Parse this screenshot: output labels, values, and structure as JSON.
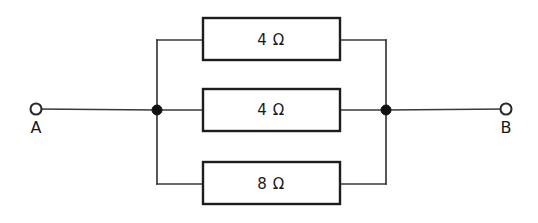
{
  "figure": {
    "type": "circuit-diagram",
    "background_color": "#ffffff",
    "line_color": "#3a3a3a",
    "box_stroke_color": "#1d1d1d",
    "node_color": "#111111"
  },
  "terminals": [
    {
      "id": "A",
      "label": "A",
      "cx": 36,
      "cy": 109,
      "r": 5.5
    },
    {
      "id": "B",
      "label": "B",
      "cx": 506,
      "cy": 109,
      "r": 5.5
    }
  ],
  "nodes": [
    {
      "id": "left-node",
      "cx": 157,
      "cy": 110,
      "r": 5
    },
    {
      "id": "right-node",
      "cx": 386,
      "cy": 110,
      "r": 5
    }
  ],
  "branches": [
    {
      "id": "top",
      "label": "4 Ω",
      "value": 4,
      "unit": "Ω",
      "box": {
        "x": 203,
        "y": 18,
        "width": 137,
        "height": 42
      },
      "label_x": 271,
      "label_y": 40
    },
    {
      "id": "middle",
      "label": "4 Ω",
      "value": 4,
      "unit": "Ω",
      "box": {
        "x": 203,
        "y": 89,
        "width": 137,
        "height": 42
      },
      "label_x": 271,
      "label_y": 110
    },
    {
      "id": "bottom",
      "label": "8 Ω",
      "value": 8,
      "unit": "Ω",
      "box": {
        "x": 203,
        "y": 162,
        "width": 137,
        "height": 42
      },
      "label_x": 271,
      "label_y": 184
    }
  ],
  "wires": {
    "lead_left": "M36,109 L157,110",
    "lead_right": "M386,110 L506,109",
    "bus_left": "M157,40 L157,184",
    "bus_right": "M386,40 L386,184",
    "top_left_stub": "M157,40 L203,40",
    "top_right_stub": "M340,40 L386,40",
    "mid_left_stub": "M157,110 L203,110",
    "mid_right_stub": "M340,110 L386,110",
    "bottom_left_stub": "M157,184 L203,184",
    "bottom_right_stub": "M340,184 L386,184"
  },
  "terminal_label_positions": {
    "A": {
      "x": 36,
      "y": 133
    },
    "B": {
      "x": 506,
      "y": 133
    }
  }
}
